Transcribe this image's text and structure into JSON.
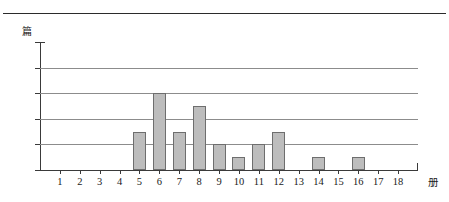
{
  "page": {
    "top_rule": "horizontal-rule"
  },
  "chart_data": {
    "type": "bar",
    "title": "",
    "xlabel": "册",
    "ylabel": "篇",
    "categories": [
      "1",
      "2",
      "3",
      "4",
      "5",
      "6",
      "7",
      "8",
      "9",
      "10",
      "11",
      "12",
      "13",
      "14",
      "15",
      "16",
      "17",
      "18"
    ],
    "values": [
      0,
      0,
      0,
      0,
      3,
      6,
      3,
      5,
      2,
      1,
      2,
      3,
      0,
      1,
      0,
      1,
      0,
      0
    ],
    "ylim": [
      0,
      10
    ],
    "yticks": [
      "0",
      "2",
      "4",
      "6",
      "8",
      "10"
    ],
    "ytick_values": [
      0,
      2,
      4,
      6,
      8,
      10
    ],
    "gridlines": [
      2,
      4,
      6,
      8
    ],
    "grid": true,
    "legend": "none",
    "bar_color": "#bdbdbd",
    "bar_border_color": "#6e6e6e",
    "axis_color": "#3a3a3a",
    "grid_color": "#8c8c8c"
  }
}
